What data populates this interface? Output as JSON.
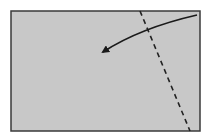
{
  "diagram": {
    "type": "fold-instruction",
    "sheet": {
      "x": 11,
      "y": 11,
      "width": 189,
      "height": 120,
      "fill": "#c8c8c8",
      "stroke": "#3a3a3a"
    },
    "fold_line": {
      "style": "dashed",
      "x1": 140,
      "y1": 11,
      "x2": 190,
      "y2": 131,
      "color": "#222222"
    },
    "arrow": {
      "path": "M197,15 Q140,28 103,52",
      "color": "#1a1a1a",
      "direction": "right-to-left"
    }
  }
}
